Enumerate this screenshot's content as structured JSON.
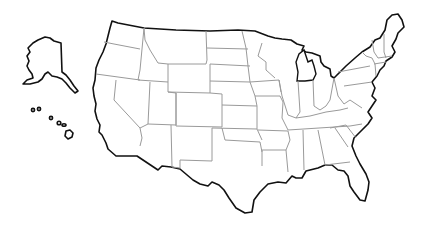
{
  "map": {
    "title": "United States outline map",
    "style": "blank outline",
    "outline_color": "#111111",
    "border_color": "#9a9a9a",
    "background": "#ffffff",
    "insets": [
      "Alaska",
      "Hawaii"
    ]
  }
}
